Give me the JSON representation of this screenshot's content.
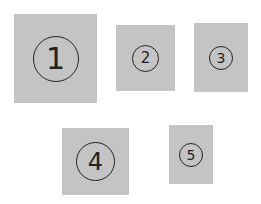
{
  "diagram": {
    "background": "#ffffff",
    "box_color": "#c4c4c4",
    "ink_color": "#222222",
    "boxes": [
      {
        "label": "1",
        "x": 14,
        "y": 14,
        "w": 83,
        "h": 89,
        "circle": 46,
        "font": 30
      },
      {
        "label": "2",
        "x": 116,
        "y": 25,
        "w": 59,
        "h": 66,
        "circle": 27,
        "font": 15
      },
      {
        "label": "3",
        "x": 194,
        "y": 23,
        "w": 54,
        "h": 69,
        "circle": 24,
        "font": 14
      },
      {
        "label": "4",
        "x": 62,
        "y": 128,
        "w": 67,
        "h": 67,
        "circle": 39,
        "font": 24
      },
      {
        "label": "5",
        "x": 169,
        "y": 125,
        "w": 44,
        "h": 59,
        "circle": 24,
        "font": 14
      }
    ]
  }
}
